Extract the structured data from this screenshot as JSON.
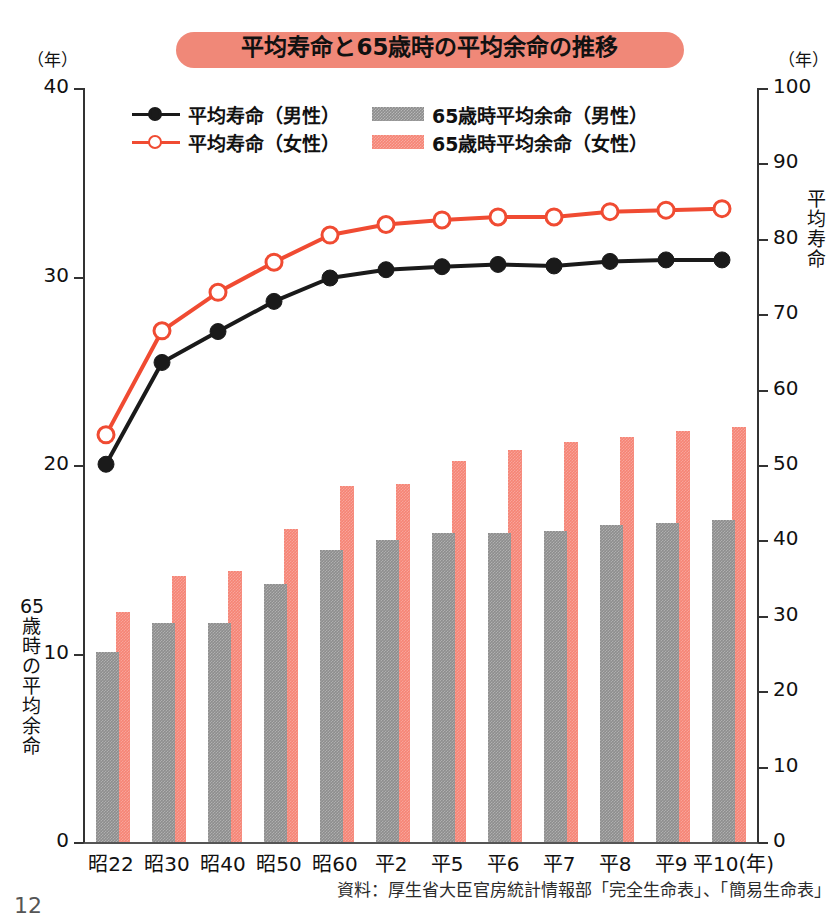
{
  "title": "平均寿命と65歳時の平均余命の推移",
  "page_number": "12",
  "source_note": "資料：厚生省大臣官房統計情報部「完全生命表」、「簡易生命表」",
  "left_axis": {
    "unit_caption": "（年）",
    "side_title_chars": [
      "65",
      "歳",
      "時",
      "の",
      "平",
      "均",
      "余",
      "命"
    ],
    "ticks": [
      "40",
      "30",
      "20",
      "10",
      "0"
    ]
  },
  "right_axis": {
    "unit_caption": "（年）",
    "side_title_chars": [
      "平",
      "均",
      "寿",
      "命"
    ],
    "ticks": [
      "100",
      "90",
      "80",
      "70",
      "60",
      "50",
      "40",
      "30",
      "20",
      "10",
      "0"
    ]
  },
  "legend": [
    {
      "label": "平均寿命（男性）",
      "type": "line",
      "color": "#1a1a1a",
      "marker": "filled-circle",
      "icon": "line-marker-filled-icon"
    },
    {
      "label": "65歳時平均余命（男性）",
      "type": "bar",
      "color": "#8d8d8d",
      "icon": "bar-swatch-gray-icon"
    },
    {
      "label": "平均寿命（女性）",
      "type": "line",
      "color": "#f04b32",
      "marker": "open-circle",
      "icon": "line-marker-open-icon"
    },
    {
      "label": "65歳時平均余命（女性）",
      "type": "bar",
      "color": "#f58475",
      "icon": "bar-swatch-pink-icon"
    }
  ],
  "colors": {
    "title_banner": "#f08878",
    "line_male": "#1a1a1a",
    "line_female": "#f04b32",
    "bar_male": "#8d8d8d",
    "bar_female": "#f58475",
    "axis": "#333333"
  },
  "chart_data": {
    "type": "bar",
    "title": "平均寿命と65歳時の平均余命の推移",
    "xlabel": "（年）",
    "ylabel": "65歳時の平均余命",
    "y2label": "平均寿命",
    "ylim": [
      0,
      40
    ],
    "y2lim": [
      0,
      100
    ],
    "yticks": [
      0,
      10,
      20,
      30,
      40
    ],
    "y2ticks": [
      0,
      10,
      20,
      30,
      40,
      50,
      60,
      70,
      80,
      90,
      100
    ],
    "grid": false,
    "legend_position": "top-center",
    "categories": [
      "昭22",
      "昭30",
      "昭40",
      "昭50",
      "昭60",
      "平2",
      "平5",
      "平6",
      "平7",
      "平8",
      "平9",
      "平10"
    ],
    "x_axis_unit_label": "（年）",
    "series": [
      {
        "name": "65歳時平均余命（男性）",
        "kind": "bar",
        "axis": "left",
        "color": "#8d8d8d",
        "values": [
          10.1,
          11.6,
          11.6,
          13.7,
          15.5,
          16.0,
          16.4,
          16.4,
          16.5,
          16.8,
          16.9,
          17.1
        ]
      },
      {
        "name": "65歳時平均余命（女性）",
        "kind": "bar",
        "axis": "left",
        "color": "#f58475",
        "values": [
          12.2,
          14.1,
          14.4,
          16.6,
          18.9,
          19.0,
          20.2,
          20.8,
          21.2,
          21.5,
          21.8,
          22.0
        ]
      },
      {
        "name": "平均寿命（男性）",
        "kind": "line",
        "axis": "right",
        "color": "#1a1a1a",
        "marker": "filled-circle",
        "values": [
          50.1,
          63.6,
          67.7,
          71.7,
          74.8,
          75.9,
          76.3,
          76.6,
          76.4,
          77.0,
          77.2,
          77.2
        ]
      },
      {
        "name": "平均寿命（女性）",
        "kind": "line",
        "axis": "right",
        "color": "#f04b32",
        "marker": "open-circle",
        "values": [
          54.0,
          67.8,
          72.9,
          76.9,
          80.5,
          81.9,
          82.5,
          82.9,
          82.9,
          83.6,
          83.8,
          84.0
        ]
      }
    ]
  }
}
